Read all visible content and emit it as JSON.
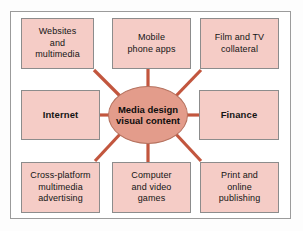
{
  "figure": {
    "title": "Media design visual content",
    "colors": {
      "box_fill": "#f5ccc6",
      "box_border": "#8c8c8c",
      "center_fill": "#e39c8b",
      "center_border": "#b5725f",
      "connector": "#c2563e",
      "frame_border": "#9b9b9b",
      "background": "#ffffff"
    }
  },
  "center": {
    "label": "Media design\nvisual content",
    "shape": "ellipse"
  },
  "nodes": [
    {
      "id": "websites",
      "label": "Websites\nand\nmultimedia",
      "emphasis": false,
      "position": "top-left"
    },
    {
      "id": "mobile",
      "label": "Mobile\nphone apps",
      "emphasis": false,
      "position": "top-center"
    },
    {
      "id": "film",
      "label": "Film and TV\ncollateral",
      "emphasis": false,
      "position": "top-right"
    },
    {
      "id": "internet",
      "label": "Internet",
      "emphasis": true,
      "position": "middle-left"
    },
    {
      "id": "finance",
      "label": "Finance",
      "emphasis": true,
      "position": "middle-right"
    },
    {
      "id": "crossplatform",
      "label": "Cross-platform\nmultimedia\nadvertising",
      "emphasis": false,
      "position": "bottom-left"
    },
    {
      "id": "games",
      "label": "Computer\nand video\ngames",
      "emphasis": false,
      "position": "bottom-center"
    },
    {
      "id": "print",
      "label": "Print and\nonline\npublishing",
      "emphasis": false,
      "position": "bottom-right"
    }
  ],
  "connectors": [
    {
      "from": "center",
      "to": "websites",
      "orientation": "diagonal"
    },
    {
      "from": "center",
      "to": "mobile",
      "orientation": "vertical"
    },
    {
      "from": "center",
      "to": "film",
      "orientation": "diagonal"
    },
    {
      "from": "center",
      "to": "internet",
      "orientation": "horizontal"
    },
    {
      "from": "center",
      "to": "finance",
      "orientation": "horizontal"
    },
    {
      "from": "center",
      "to": "crossplatform",
      "orientation": "diagonal"
    },
    {
      "from": "center",
      "to": "games",
      "orientation": "vertical"
    },
    {
      "from": "center",
      "to": "print",
      "orientation": "diagonal"
    }
  ]
}
